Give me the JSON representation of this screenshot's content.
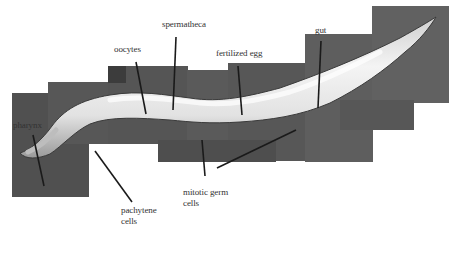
{
  "figure": {
    "colors": {
      "background": "#ffffff",
      "tile_dark": "#4a4a4a",
      "tile_mid": "#585858",
      "tile_light": "#666666",
      "worm_body": "#e8e8e8",
      "leader_line": "#1a1a1a",
      "label_text": "#333333"
    }
  },
  "labels": {
    "pharynx": "pharynx",
    "oocytes": "oocytes",
    "spermatheca": "spermatheca",
    "fertilized_egg": "fertilized egg",
    "gut": "gut",
    "pachytene_line1": "pachytene",
    "pachytene_line2": "cells",
    "mitotic_line1": "mitotic germ",
    "mitotic_line2": "cells"
  }
}
